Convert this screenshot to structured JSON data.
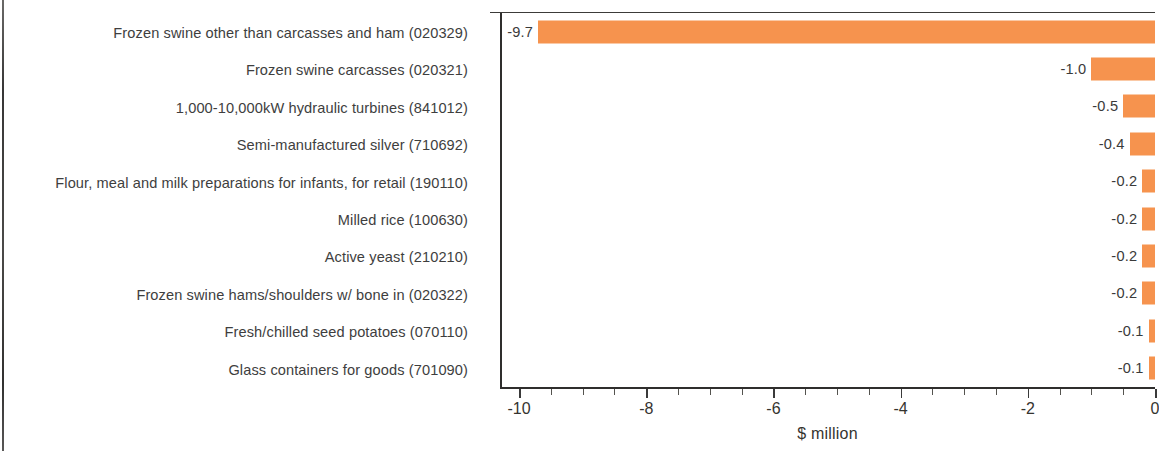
{
  "chart_data": {
    "type": "bar",
    "orientation": "horizontal",
    "title": "",
    "xlabel": "$ million",
    "ylabel": "",
    "xlim": [
      -10.3,
      0
    ],
    "grid": false,
    "legend": null,
    "bar_color": "#F6934E",
    "categories": [
      "Frozen swine other than carcasses and ham (020329)",
      "Frozen swine carcasses (020321)",
      "1,000-10,000kW hydraulic turbines (841012)",
      "Semi-manufactured silver (710692)",
      "Flour, meal and milk preparations for infants, for retail (190110)",
      "Milled rice (100630)",
      "Active yeast (210210)",
      "Frozen swine hams/shoulders w/ bone in (020322)",
      "Fresh/chilled seed potatoes (070110)",
      "Glass containers for goods (701090)"
    ],
    "values": [
      -9.7,
      -1.0,
      -0.5,
      -0.4,
      -0.2,
      -0.2,
      -0.2,
      -0.2,
      -0.1,
      -0.1
    ],
    "value_labels": [
      "-9.7",
      "-1.0",
      "-0.5",
      "-0.4",
      "-0.2",
      "-0.2",
      "-0.2",
      "-0.2",
      "-0.1",
      "-0.1"
    ],
    "x_ticks": [
      -10,
      -8,
      -6,
      -4,
      -2,
      0
    ],
    "x_tick_labels": [
      "-10",
      "-8",
      "-6",
      "-4",
      "-2",
      "0"
    ],
    "x_minor_tick_step": 0.5
  }
}
